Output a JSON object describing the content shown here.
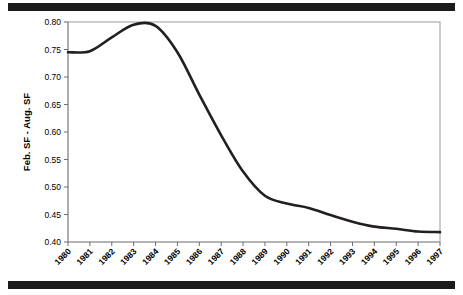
{
  "figure": {
    "top_rule": "",
    "bottom_rule": ""
  },
  "chart_data": {
    "type": "line",
    "title": "",
    "xlabel": "",
    "ylabel": "Feb. SF - Aug. SF",
    "xlim": [
      1980,
      1997
    ],
    "ylim": [
      0.4,
      0.8
    ],
    "grid": false,
    "legend": null,
    "line_color": "#231f20",
    "x": [
      1980,
      1981,
      1982,
      1983,
      1984,
      1985,
      1986,
      1987,
      1988,
      1989,
      1990,
      1991,
      1992,
      1993,
      1994,
      1995,
      1996,
      1997
    ],
    "categories": [
      "1980",
      "1981",
      "1982",
      "1983",
      "1984",
      "1985",
      "1986",
      "1987",
      "1988",
      "1989",
      "1990",
      "1991",
      "1992",
      "1993",
      "1994",
      "1995",
      "1996",
      "1997"
    ],
    "values": [
      0.745,
      0.747,
      0.772,
      0.795,
      0.793,
      0.745,
      0.668,
      0.594,
      0.528,
      0.484,
      0.47,
      0.462,
      0.449,
      0.437,
      0.428,
      0.424,
      0.419,
      0.418
    ],
    "series": [
      {
        "name": "Feb. SF - Aug. SF",
        "values": [
          0.745,
          0.747,
          0.772,
          0.795,
          0.793,
          0.745,
          0.668,
          0.594,
          0.528,
          0.484,
          0.47,
          0.462,
          0.449,
          0.437,
          0.428,
          0.424,
          0.419,
          0.418
        ]
      }
    ],
    "ytick_labels": [
      "0.40",
      "0.45",
      "0.50",
      "0.55",
      "0.60",
      "0.65",
      "0.70",
      "0.75",
      "0.80"
    ],
    "ytick_values": [
      0.4,
      0.45,
      0.5,
      0.55,
      0.6,
      0.65,
      0.7,
      0.75,
      0.8
    ],
    "peak": {
      "x": 1983.5,
      "y": 0.798
    }
  }
}
